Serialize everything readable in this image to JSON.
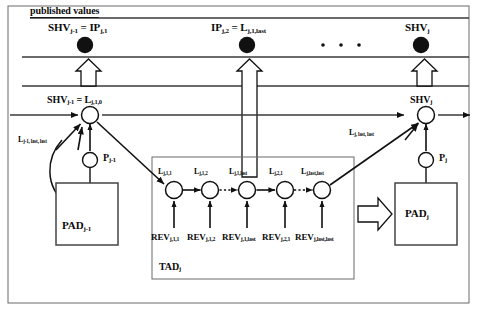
{
  "figure": {
    "title": "published values"
  },
  "published_band": {
    "caption": "published values",
    "nodes": [
      {
        "id": "pub-node-1",
        "label_main": "SHV",
        "label_sub": "j-1",
        "label_eq": " = IP",
        "label_eq_sub": "j,1",
        "full": "SHV j-1 = IP j,1",
        "x": 85
      },
      {
        "id": "pub-node-2",
        "label_main": "IP",
        "label_sub": "j,2",
        "label_eq": " = L",
        "label_eq_sub": "j,1,last",
        "full": "IP j,2 = L j,1,last",
        "x": 247
      },
      {
        "id": "pub-node-3",
        "label_main": "SHV",
        "label_sub": "j",
        "label_eq": "",
        "label_eq_sub": "",
        "full": "SHV j",
        "x": 421
      }
    ],
    "ellipsis": "·  ·  ·"
  },
  "timeline": {
    "left_node": {
      "label_main": "SHV",
      "label_sub": "j-1",
      "label_eq": " = L",
      "label_eq_sub": "j,1,0",
      "full": "SHV j-1 = L j,1,0"
    },
    "right_node": {
      "label_main": "SHV",
      "label_sub": "j",
      "full": "SHV j"
    },
    "left_incoming_label": {
      "main": "L",
      "sub": "j-1, last, last",
      "full": "L j-1, last, last"
    },
    "right_incoming_label": {
      "main": "L",
      "sub": "j, last, last",
      "full": "L j, last, last"
    }
  },
  "processors": [
    {
      "id": "p-left",
      "main": "P",
      "sub": "j-1",
      "full": "P j-1"
    },
    {
      "id": "p-right",
      "main": "P",
      "sub": "j",
      "full": "P j"
    }
  ],
  "pads": [
    {
      "id": "pad-left",
      "main": "PAD",
      "sub": "j-1",
      "full": "PAD j-1"
    },
    {
      "id": "pad-right",
      "main": "PAD",
      "sub": "j",
      "full": "PAD j"
    }
  ],
  "tad": {
    "label_main": "TAD",
    "label_sub": "j",
    "full": "TAD j",
    "nodes": [
      {
        "main": "L",
        "sub": "j,1,1",
        "full": "L j,1,1",
        "x": 174
      },
      {
        "main": "L",
        "sub": "j,1,2",
        "full": "L j,1,2",
        "x": 210
      },
      {
        "main": "L",
        "sub": "j,1,last",
        "full": "L j,1,last",
        "x": 247
      },
      {
        "main": "L",
        "sub": "j,2,1",
        "full": "L j,2,1",
        "x": 285
      },
      {
        "main": "L",
        "sub": "j,last,last",
        "full": "L j,last,last",
        "x": 322
      }
    ],
    "revisions": [
      {
        "main": "REV",
        "sub": "j,1,1",
        "full": "REV j,1,1",
        "x": 174
      },
      {
        "main": "REV",
        "sub": "j,1,2",
        "full": "REV j,1,2",
        "x": 210
      },
      {
        "main": "REV",
        "sub": "j,1,last",
        "full": "REV j,1,last",
        "x": 247
      },
      {
        "main": "REV",
        "sub": "j,2,1",
        "full": "REV j,2,1",
        "x": 285
      },
      {
        "main": "REV",
        "sub": "j,last,last",
        "full": "REV j,last,last",
        "x": 322
      }
    ],
    "link_styles": [
      "solid",
      "dotted",
      "solid",
      "dotted"
    ]
  },
  "colors": {
    "ink": "#111111",
    "line": "#3a3a3a",
    "box_border": "#555555",
    "background": "#ffffff"
  }
}
